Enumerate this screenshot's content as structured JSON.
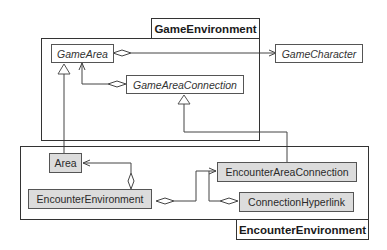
{
  "packages": {
    "game_environment": {
      "label": "GameEnvironment"
    },
    "encounter_environment": {
      "label": "EncounterEnvironment"
    }
  },
  "classes": {
    "game_area": {
      "name": "GameArea",
      "abstract": true
    },
    "game_character": {
      "name": "GameCharacter",
      "abstract": true
    },
    "game_area_connection": {
      "name": "GameAreaConnection",
      "abstract": true
    },
    "area": {
      "name": "Area",
      "abstract": false
    },
    "encounter_environment": {
      "name": "EncounterEnvironment",
      "abstract": false
    },
    "encounter_area_connection": {
      "name": "EncounterAreaConnection",
      "abstract": false
    },
    "connection_hyperlink": {
      "name": "ConnectionHyperlink",
      "abstract": false
    }
  },
  "relationships": [
    {
      "type": "aggregation",
      "from": "GameArea",
      "to": "GameCharacter",
      "navigable": true
    },
    {
      "type": "aggregation",
      "from": "GameAreaConnection",
      "to": "GameArea",
      "navigable": true
    },
    {
      "type": "generalization",
      "from": "Area",
      "to": "GameArea"
    },
    {
      "type": "generalization",
      "from": "EncounterAreaConnection",
      "to": "GameAreaConnection"
    },
    {
      "type": "aggregation",
      "from": "EncounterEnvironment",
      "to": "Area",
      "navigable": true
    },
    {
      "type": "aggregation",
      "from": "EncounterEnvironment",
      "to": "EncounterAreaConnection",
      "navigable": true
    },
    {
      "type": "aggregation",
      "from": "ConnectionHyperlink",
      "to": "EncounterAreaConnection",
      "navigable": true
    }
  ],
  "colors": {
    "concrete_fill": "#dcdcdc",
    "abstract_fill": "#ffffff",
    "line": "#444444"
  }
}
